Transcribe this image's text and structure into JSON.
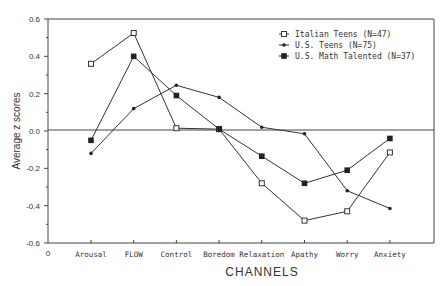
{
  "chart_data": {
    "type": "line",
    "title": "",
    "xlabel": "CHANNELS",
    "ylabel": "Average z scores",
    "origin_label": "0",
    "categories": [
      "Arousal",
      "FLOW",
      "Control",
      "Boredom",
      "Relaxation",
      "Apathy",
      "Worry",
      "Anxiety"
    ],
    "ylim": [
      -0.6,
      0.6
    ],
    "yticks": [
      0.6,
      0.4,
      0.2,
      0.0,
      -0.2,
      -0.4,
      -0.6
    ],
    "ytick_labels": [
      "0.6",
      "0.4",
      "0.2",
      "0.0",
      "-0.2",
      "-0.4",
      "-0.6"
    ],
    "grid": false,
    "reference_line": 0.0,
    "legend_position": "upper right",
    "series": [
      {
        "name": "Italian Teens (N=47)",
        "marker": "open-square",
        "values": [
          0.36,
          0.525,
          0.015,
          0.01,
          -0.28,
          -0.48,
          -0.43,
          -0.115
        ]
      },
      {
        "name": "U.S. Teens (N=75)",
        "marker": "small-dot",
        "values": [
          -0.12,
          0.12,
          0.245,
          0.18,
          0.02,
          -0.015,
          -0.32,
          -0.415
        ]
      },
      {
        "name": "U.S. Math Talented (N=37)",
        "marker": "filled-square",
        "values": [
          -0.05,
          0.4,
          0.19,
          0.01,
          -0.135,
          -0.28,
          -0.21,
          -0.04
        ]
      }
    ]
  }
}
